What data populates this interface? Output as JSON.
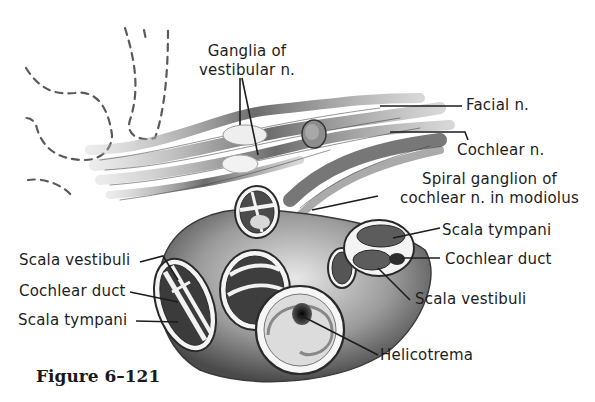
{
  "figure": {
    "caption": "Figure 6–121"
  },
  "labels": {
    "ganglia_vestibular_line1": "Ganglia of",
    "ganglia_vestibular_line2": "vestibular n.",
    "facial_n": "Facial n.",
    "cochlear_n": "Cochlear n.",
    "spiral_ganglion_line1": "Spiral ganglion of",
    "spiral_ganglion_line2": "cochlear n. in modiolus",
    "scala_tympani_right": "Scala tympani",
    "cochlear_duct_right": "Cochlear duct",
    "scala_vestibuli_right": "Scala vestibuli",
    "helicotrema": "Helicotrema",
    "scala_vestibuli_left": "Scala vestibuli",
    "cochlear_duct_left": "Cochlear duct",
    "scala_tympani_left": "Scala tympani"
  },
  "colors": {
    "ink": "#1d1d1d",
    "shade_dark": "#3a3a3a",
    "shade_mid": "#7a7a7a",
    "shade_light": "#c8c8c8",
    "background": "#ffffff"
  }
}
